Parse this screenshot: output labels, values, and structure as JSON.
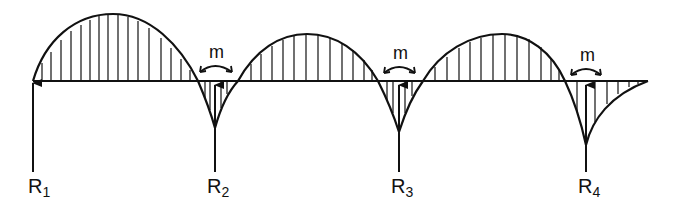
{
  "diagram": {
    "type": "bending-moment-diagram",
    "colors": {
      "ink": "#111111",
      "background": "#ffffff"
    },
    "supports": [
      {
        "id": "R1",
        "label": "R",
        "subscript": "1"
      },
      {
        "id": "R2",
        "label": "R",
        "subscript": "2"
      },
      {
        "id": "R3",
        "label": "R",
        "subscript": "3"
      },
      {
        "id": "R4",
        "label": "R",
        "subscript": "4"
      }
    ],
    "moment_labels": [
      {
        "at": "R2",
        "text": "m"
      },
      {
        "at": "R3",
        "text": "m"
      },
      {
        "at": "R4",
        "text": "m"
      }
    ]
  }
}
